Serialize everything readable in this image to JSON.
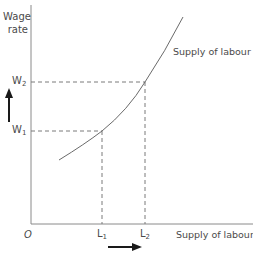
{
  "diagram": {
    "y_axis_label_line1": "Wage",
    "y_axis_label_line2": "rate",
    "x_axis_label": "Supply of labour",
    "origin_label": "O",
    "curve_label": "Supply of labour",
    "wage_levels": [
      {
        "base": "W",
        "sub": "1"
      },
      {
        "base": "W",
        "sub": "2"
      }
    ],
    "labour_levels": [
      {
        "base": "L",
        "sub": "1"
      },
      {
        "base": "L",
        "sub": "2"
      }
    ],
    "arrows": {
      "vertical": "wage increases from W1 to W2",
      "horizontal": "labour supplied increases from L1 to L2"
    },
    "colors": {
      "axis": "#8a8a8a",
      "curve": "#6a6a6a",
      "dashed": "#7a7a7a",
      "arrow": "#1a1a1a",
      "text": "#4a4a4a"
    }
  }
}
